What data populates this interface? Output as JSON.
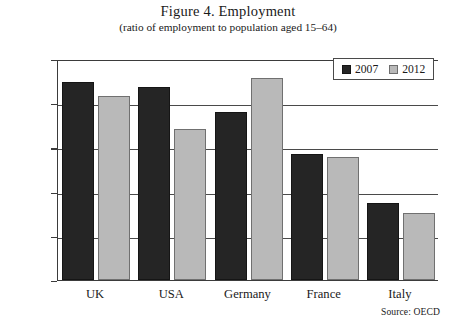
{
  "chart_data": {
    "type": "bar",
    "title": "Figure 4. Employment",
    "subtitle": "(ratio of employment to population aged 15–64)",
    "xlabel": "",
    "ylabel": "",
    "categories": [
      "UK",
      "USA",
      "Germany",
      "France",
      "Italy"
    ],
    "series": [
      {
        "name": "2007",
        "color": "#252525",
        "values": [
          72.4,
          71.8,
          69.0,
          64.3,
          58.7
        ]
      },
      {
        "name": "2012",
        "color": "#b9b9b9",
        "values": [
          70.8,
          67.1,
          72.8,
          63.9,
          57.6
        ]
      }
    ],
    "ylim": [
      50.0,
      75.0
    ],
    "yticks": [
      "50.0",
      "55.0",
      "60.0",
      "65.0",
      "70.0",
      "75.0"
    ],
    "ytick_values": [
      50.0,
      55.0,
      60.0,
      65.0,
      70.0,
      75.0
    ],
    "grid": true,
    "legend_position": "top-right",
    "annotation": "Source: OECD"
  }
}
